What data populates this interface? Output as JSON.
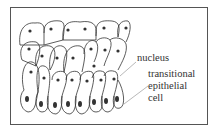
{
  "diagram": {
    "labels": {
      "nucleus": "nucleus",
      "cell_line1": "transitional",
      "cell_line2": "epithelial",
      "cell_line3": "cell"
    },
    "colors": {
      "outline": "#333333",
      "nucleus": "#333333",
      "frame": "#555555",
      "background": "#ffffff"
    },
    "layers": [
      {
        "row": "surface",
        "cell_count": 6
      },
      {
        "row": "intermediate",
        "cell_count": 7
      },
      {
        "row": "lower",
        "cell_count": 8
      },
      {
        "row": "basal",
        "cell_count": 8
      }
    ]
  }
}
